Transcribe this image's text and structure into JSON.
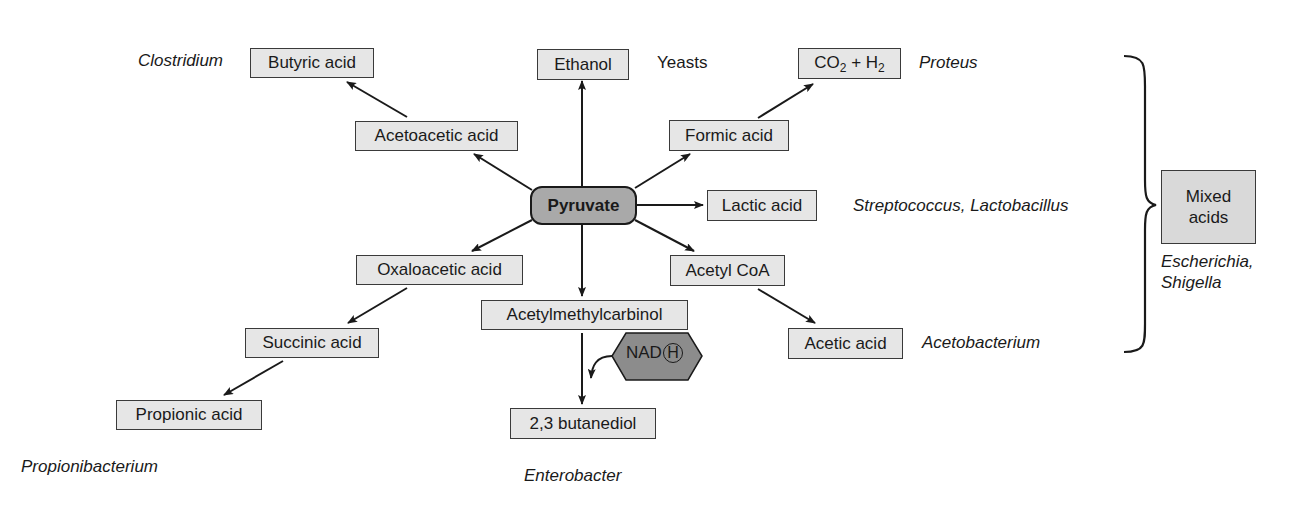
{
  "diagram": {
    "center": {
      "label": "Pyruvate",
      "fill": "#a9a9a9"
    },
    "box_fill": "#e6e6e6",
    "products": {
      "butyric_acid": "Butyric acid",
      "ethanol": "Ethanol",
      "co2": "CO",
      "co2_sub": "2",
      "plus": " + H",
      "h2_sub": "2",
      "acetoacetic_acid": "Acetoacetic acid",
      "formic_acid": "Formic acid",
      "lactic_acid": "Lactic acid",
      "oxaloacetic_acid": "Oxaloacetic acid",
      "acetyl_coa": "Acetyl CoA",
      "acetylmethylcarbinol": "Acetylmethylcarbinol",
      "succinic_acid": "Succinic acid",
      "acetic_acid": "Acetic acid",
      "propionic_acid": "Propionic acid",
      "butanediol": "2,3 butanediol",
      "mixed_acids_line1": "Mixed",
      "mixed_acids_line2": "acids"
    },
    "cofactor": {
      "label": "NAD",
      "circled": "H",
      "fill": "#8c8c8c"
    },
    "organisms": {
      "clostridium": "Clostridium",
      "yeasts": "Yeasts",
      "proteus": "Proteus",
      "strep_lacto": "Streptococcus, Lactobacillus",
      "acetobacterium": "Acetobacterium",
      "propionibacterium": "Propionibacterium",
      "enterobacter": "Enterobacter",
      "escherichia": "Escherichia,",
      "shigella": "Shigella"
    },
    "edges": [
      {
        "from": "Pyruvate",
        "to": "Ethanol"
      },
      {
        "from": "Pyruvate",
        "to": "Acetoacetic acid"
      },
      {
        "from": "Acetoacetic acid",
        "to": "Butyric acid"
      },
      {
        "from": "Pyruvate",
        "to": "Formic acid"
      },
      {
        "from": "Formic acid",
        "to": "CO2 + H2"
      },
      {
        "from": "Pyruvate",
        "to": "Lactic acid"
      },
      {
        "from": "Pyruvate",
        "to": "Oxaloacetic acid"
      },
      {
        "from": "Oxaloacetic acid",
        "to": "Succinic acid"
      },
      {
        "from": "Succinic acid",
        "to": "Propionic acid"
      },
      {
        "from": "Pyruvate",
        "to": "Acetylmethylcarbinol"
      },
      {
        "from": "Acetylmethylcarbinol",
        "to": "2,3 butanediol"
      },
      {
        "from": "Pyruvate",
        "to": "Acetyl CoA"
      },
      {
        "from": "Acetyl CoA",
        "to": "Acetic acid"
      }
    ]
  }
}
